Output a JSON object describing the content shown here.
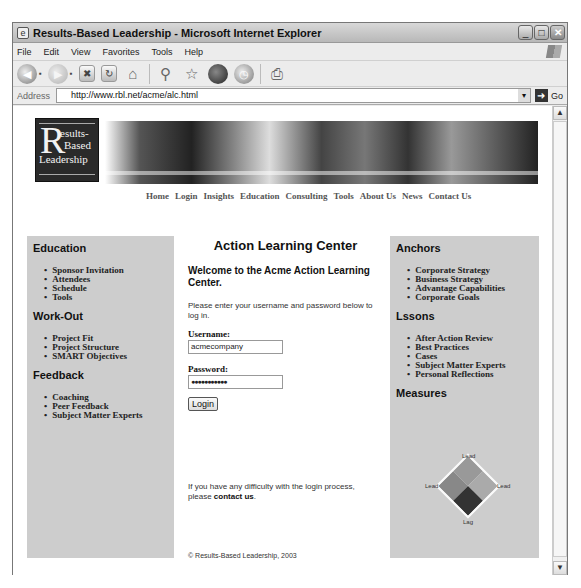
{
  "window": {
    "title": "Results-Based Leadership - Microsoft Internet Explorer",
    "controls": [
      "minimize",
      "maximize",
      "close"
    ]
  },
  "menu": [
    "File",
    "Edit",
    "View",
    "Favorites",
    "Tools",
    "Help"
  ],
  "toolbar": {
    "icons": [
      "back-icon",
      "forward-icon",
      "stop-icon",
      "refresh-icon",
      "home-icon",
      "search-icon",
      "favorites-icon",
      "media-icon",
      "history-icon",
      "print-icon"
    ]
  },
  "address": {
    "label": "Address",
    "url": "http://www.rbl.net/acme/alc.html",
    "go_label": "Go"
  },
  "site": {
    "logo": {
      "big_letter": "R",
      "line1": "esults-",
      "line2": "Based",
      "line3": "Leadership"
    },
    "nav": [
      "Home",
      "Login",
      "Insights",
      "Education",
      "Consulting",
      "Tools",
      "About Us",
      "News",
      "Contact Us"
    ]
  },
  "left_panel": {
    "sections": [
      {
        "title": "Education",
        "items": [
          "Sponsor Invitation",
          "Attendees",
          "Schedule",
          "Tools"
        ]
      },
      {
        "title": "Work-Out",
        "items": [
          "Project Fit",
          "Project Structure",
          "SMART Objectives"
        ]
      },
      {
        "title": "Feedback",
        "items": [
          "Coaching",
          "Peer Feedback",
          "Subject Matter Experts"
        ]
      }
    ]
  },
  "center": {
    "title": "Action Learning Center",
    "welcome": "Welcome to the Acme Action Learning Center.",
    "instructions": "Please enter your username and password below to log in.",
    "username_label": "Username:",
    "username_value": "acmecompany",
    "password_label": "Password:",
    "password_value": "●●●●●●●●●●●",
    "login_button": "Login",
    "help_text": "If you have any difficulty with the login process, please ",
    "help_link": "contact us",
    "help_end": ".",
    "copyright": "© Results-Based Leadership, 2003"
  },
  "right_panel": {
    "sections": [
      {
        "title": "Anchors",
        "items": [
          "Corporate Strategy",
          "Business Strategy",
          "Advantage Capabilities",
          "Corporate Goals"
        ]
      },
      {
        "title": "Lssons",
        "items": [
          "After Action Review",
          "Best Practices",
          "Cases",
          "Subject Matter Experts",
          "Personal Reflections"
        ]
      },
      {
        "title": "Measures",
        "items": []
      }
    ],
    "diagram_labels": {
      "top": "Lead",
      "left": "Lead",
      "right": "Lead",
      "bottom": "Lag"
    }
  }
}
